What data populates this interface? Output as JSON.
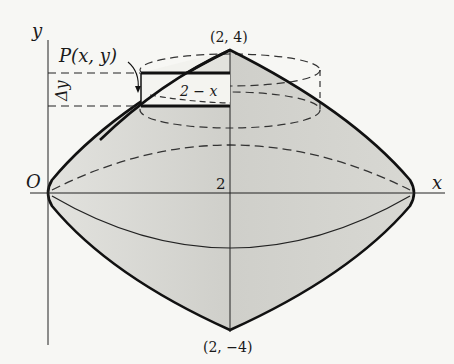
{
  "figure": {
    "axes": {
      "x_label": "x",
      "y_label": "y",
      "origin_label": "O",
      "tick_x": "2"
    },
    "points": {
      "top": "(2, 4)",
      "bottom": "(2, −4)",
      "point_p": "P(x, y)"
    },
    "annotations": {
      "delta_y": "Δy",
      "radius": "2 − x"
    },
    "colors": {
      "fill": "#c9c9c4",
      "fill_light": "#dcdcd8",
      "stroke": "#1a1a1a",
      "background": "#f7f7f4"
    }
  }
}
